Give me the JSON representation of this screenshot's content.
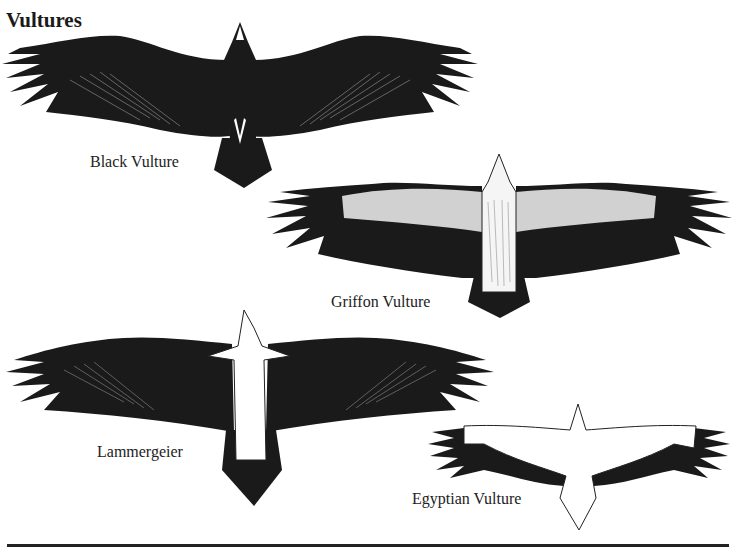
{
  "page": {
    "cutoff_line": "",
    "heading": "Vultures",
    "birds": [
      {
        "name": "Black Vulture",
        "illustration": "black-vulture-underside",
        "plumage": "uniformly dark, dark body, wedge tail"
      },
      {
        "name": "Griffon Vulture",
        "illustration": "griffon-vulture-underside",
        "plumage": "pale body and coverts, dark flight feathers"
      },
      {
        "name": "Lammergeier",
        "illustration": "lammergeier-underside",
        "plumage": "pale body, dark wings, long wedge tail"
      },
      {
        "name": "Egyptian Vulture",
        "illustration": "egyptian-vulture-underside",
        "plumage": "white body and coverts, black flight feathers"
      }
    ],
    "colors": {
      "ink": "#1a1a1a",
      "paper": "#ffffff",
      "pale": "#f2f2f2"
    }
  }
}
